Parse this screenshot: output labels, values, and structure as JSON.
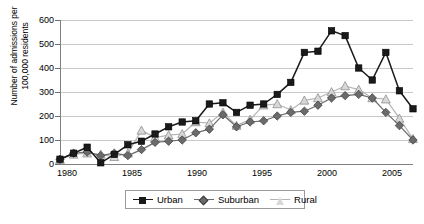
{
  "chart_data": {
    "type": "line",
    "title": "",
    "xlabel": "",
    "ylabel": "Number of admissions per 100,000 residents",
    "ylabel_line1": "Number of admissions per",
    "ylabel_line2": "100,000 residents",
    "ylim": [
      0,
      600
    ],
    "ytick_step": 100,
    "yticks": [
      "0",
      "100",
      "200",
      "300",
      "400",
      "500",
      "600"
    ],
    "xlim": [
      1980,
      2006
    ],
    "xticks": [
      "1980",
      "1985",
      "1990",
      "1995",
      "2000",
      "2005"
    ],
    "x": [
      1980,
      1981,
      1982,
      1983,
      1984,
      1985,
      1986,
      1987,
      1988,
      1989,
      1990,
      1991,
      1992,
      1993,
      1994,
      1995,
      1996,
      1997,
      1998,
      1999,
      2000,
      2001,
      2002,
      2003,
      2004,
      2005,
      2006
    ],
    "grid": true,
    "legend_position": "bottom",
    "series": [
      {
        "name": "Urban",
        "color": "#1a1a1a",
        "marker": "square",
        "values": [
          20,
          45,
          70,
          5,
          40,
          80,
          95,
          125,
          155,
          175,
          180,
          250,
          255,
          215,
          245,
          250,
          290,
          340,
          465,
          470,
          555,
          535,
          400,
          350,
          465,
          305,
          230
        ]
      },
      {
        "name": "Suburban",
        "color": "#6b6b6b",
        "marker": "diamond",
        "values": [
          20,
          45,
          50,
          35,
          45,
          35,
          60,
          90,
          95,
          100,
          130,
          145,
          205,
          155,
          175,
          180,
          200,
          215,
          220,
          245,
          275,
          285,
          290,
          275,
          215,
          160,
          100
        ]
      },
      {
        "name": "Rural",
        "color": "#d8d8d8",
        "marker": "triangle",
        "values": [
          18,
          40,
          45,
          40,
          30,
          45,
          140,
          110,
          120,
          125,
          175,
          170,
          215,
          160,
          185,
          245,
          250,
          225,
          265,
          275,
          300,
          325,
          310,
          275,
          270,
          190,
          105
        ]
      }
    ]
  },
  "legend": {
    "items": [
      {
        "label": "Urban"
      },
      {
        "label": "Suburban"
      },
      {
        "label": "Rural"
      }
    ]
  }
}
